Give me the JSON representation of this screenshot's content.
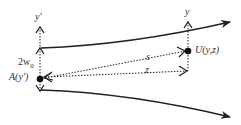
{
  "diagram": {
    "labels": {
      "y_prime_axis": "y'",
      "y_axis": "y",
      "beam_width": "2w",
      "beam_width_sub": "0",
      "point_a": "A(y')",
      "point_u": "U(y,z)",
      "distance_s": "s",
      "distance_z": "z"
    },
    "colors": {
      "line": "#222222",
      "text": "#333333",
      "background": "#ffffff"
    }
  }
}
